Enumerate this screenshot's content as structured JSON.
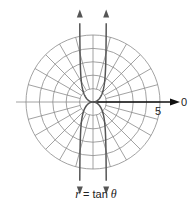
{
  "figure": {
    "caption_var": "r",
    "caption_eq": " = tan ",
    "caption_theta": "θ",
    "axis_label_zero": "0",
    "axis_tick_label": "5"
  },
  "grid": {
    "type": "polar",
    "rings": [
      1,
      2,
      3,
      4,
      5
    ],
    "radial_spacing_deg": 15,
    "center_px": [
      93,
      102
    ],
    "unit_px": 13.4,
    "colors": {
      "grid": "#8a8a8a",
      "curve": "#555555",
      "axis": "#111111"
    }
  },
  "chart_data": {
    "type": "line",
    "title": "r = tan θ",
    "coordinate_system": "polar",
    "equation": "r = tan(theta)",
    "r_range": [
      0,
      5
    ],
    "ring_values": [
      1,
      2,
      3,
      4,
      5
    ],
    "angle_gridlines_deg": 15,
    "labels": {
      "polar_axis": "0",
      "radius_tick": "5"
    }
  }
}
